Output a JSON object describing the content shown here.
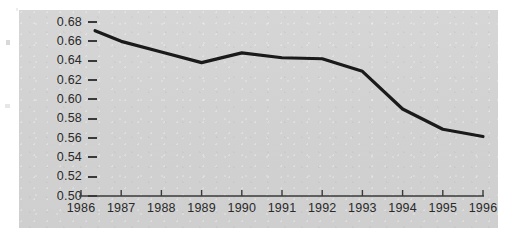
{
  "chart_data": {
    "type": "line",
    "title": "",
    "subtitle": "",
    "xlabel": "",
    "ylabel": "",
    "x": [
      1986,
      1987,
      1988,
      1989,
      1990,
      1991,
      1992,
      1993,
      1994,
      1995,
      1996
    ],
    "series": [
      {
        "name": "series-1",
        "values": [
          0.671,
          0.66,
          0.649,
          0.638,
          0.648,
          0.643,
          0.642,
          0.629,
          0.59,
          0.569,
          0.5615
        ]
      }
    ],
    "xlim": [
      1986,
      1996
    ],
    "ylim": [
      0.5,
      0.68
    ],
    "ytick_values": [
      0.68,
      0.66,
      0.64,
      0.62,
      0.6,
      0.58,
      0.56,
      0.54,
      0.52,
      0.5
    ],
    "ytick_labels": [
      "0.68",
      "0.66",
      "0.64",
      "0.62",
      "0.60",
      "0.58",
      "0.56",
      "0.54",
      "0.52",
      "0.50"
    ],
    "xtick_labels": [
      "1986",
      "1987",
      "1988",
      "1989",
      "1990",
      "1991",
      "1992",
      "1993",
      "1994",
      "1995",
      "1996"
    ],
    "grid": false,
    "legend": null,
    "legend_position": "none",
    "line_color": "#1a1a1a",
    "panel_color": "#d2d2d2",
    "axis_color": "#3a3a3a",
    "text_color": "#2a2a2a",
    "line_start_x": 1986.35,
    "annotations": []
  }
}
